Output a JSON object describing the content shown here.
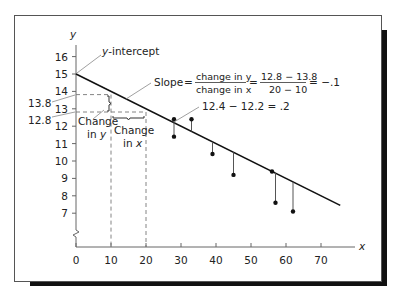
{
  "chart_data": {
    "type": "scatter",
    "title": "",
    "xlabel": "x",
    "ylabel": "y",
    "xlim": [
      0,
      75
    ],
    "ylim": [
      6,
      16.5
    ],
    "x_ticks": [
      "0",
      "10",
      "20",
      "30",
      "40",
      "50",
      "60",
      "70"
    ],
    "y_ticks": [
      "7",
      "8",
      "9",
      "10",
      "11",
      "12",
      "13",
      "14",
      "15",
      "16"
    ],
    "y_axis_break": true,
    "grid": false,
    "legend": null,
    "series": [
      {
        "name": "observations",
        "points": [
          {
            "x": 28,
            "y": 12.4
          },
          {
            "x": 28,
            "y": 11.4
          },
          {
            "x": 33,
            "y": 12.4
          },
          {
            "x": 39,
            "y": 10.4
          },
          {
            "x": 45,
            "y": 9.2
          },
          {
            "x": 56,
            "y": 9.4
          },
          {
            "x": 57,
            "y": 7.6
          },
          {
            "x": 62,
            "y": 7.1
          }
        ]
      },
      {
        "name": "regression line",
        "type": "line",
        "intercept": 15,
        "slope": -0.1,
        "x": [
          0,
          75.5
        ],
        "y": [
          15,
          7.45
        ]
      }
    ],
    "guides": {
      "x1": 10,
      "y1": 13.8,
      "x2": 20,
      "y2": 12.8
    },
    "annotations": {
      "intercept": "y-intercept",
      "slope_label": "Slope",
      "slope_num": "change in y",
      "slope_den": "change in x",
      "slope_num_vals": "12.8 − 13.8",
      "slope_den_vals": "20 − 10",
      "slope_result": "= −.1",
      "residual": "12.4 − 12.2 = .2",
      "y_val_1": "13.8",
      "y_val_2": "12.8",
      "change_in_y_line1": "Change",
      "change_in_y_line2": "in y",
      "change_in_x_line1": "Change",
      "change_in_x_line2": "in x"
    }
  }
}
